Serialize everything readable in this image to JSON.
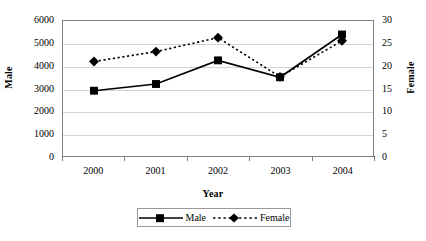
{
  "chart_data": {
    "type": "line",
    "title": "",
    "xlabel": "Year",
    "ylabel": "Male",
    "y2label": "Female",
    "categories": [
      "2000",
      "2001",
      "2002",
      "2003",
      "2004"
    ],
    "x": [
      2000,
      2001,
      2002,
      2003,
      2004
    ],
    "grid": true,
    "legend_position": "bottom",
    "ylim": [
      0,
      6000
    ],
    "y2lim": [
      0,
      30
    ],
    "yticks": [
      "0",
      "1000",
      "2000",
      "3000",
      "4000",
      "5000",
      "6000"
    ],
    "ytick_values": [
      0,
      1000,
      2000,
      3000,
      4000,
      5000,
      6000
    ],
    "y2ticks": [
      "0",
      "5",
      "10",
      "15",
      "20",
      "25",
      "30"
    ],
    "y2tick_values": [
      0,
      5,
      10,
      15,
      20,
      25,
      30
    ],
    "series": [
      {
        "name": "Male",
        "axis": "left",
        "marker": "square",
        "line_style": "solid",
        "color": "#000000",
        "values": [
          2900,
          3200,
          4250,
          3500,
          5400
        ]
      },
      {
        "name": "Female",
        "axis": "right",
        "marker": "diamond",
        "line_style": "dotted",
        "color": "#000000",
        "values": [
          21.0,
          23.2,
          26.3,
          17.6,
          25.6
        ]
      }
    ]
  },
  "legend": {
    "items": [
      {
        "label": "Male",
        "marker": "square-marker",
        "style": "solid-line"
      },
      {
        "label": "Female",
        "marker": "diamond-marker",
        "style": "dotted-line"
      }
    ]
  },
  "colors": {
    "series": "#000000",
    "gridline": "#d4d4d4",
    "axis": "#808080",
    "background": "#ffffff"
  }
}
